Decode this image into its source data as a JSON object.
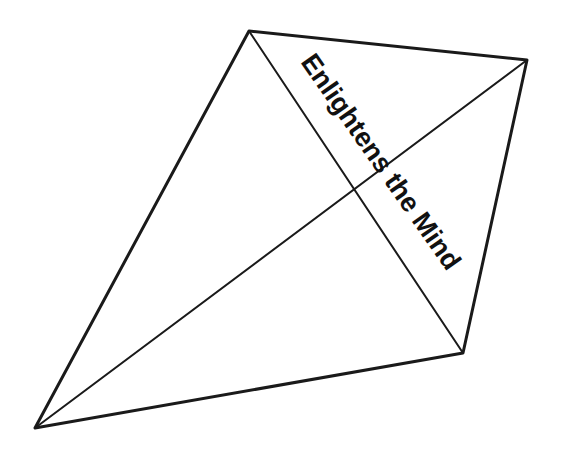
{
  "figure": {
    "shape": "kite",
    "vertices": {
      "top": [
        249,
        31
      ],
      "right": [
        527,
        60
      ],
      "bottom_right": [
        463,
        353
      ],
      "bottom_left": [
        35,
        428
      ]
    },
    "diagonals": [
      {
        "from": "top",
        "to": "bottom_right"
      },
      {
        "from": "right",
        "to": "bottom_left"
      }
    ],
    "stroke_color": "#1a1a1a",
    "background_color": "#ffffff"
  },
  "label": {
    "text": "Enlightens the Mind",
    "rotation_deg": 55,
    "anchor": [
      303,
      58
    ],
    "color": "#111111"
  }
}
